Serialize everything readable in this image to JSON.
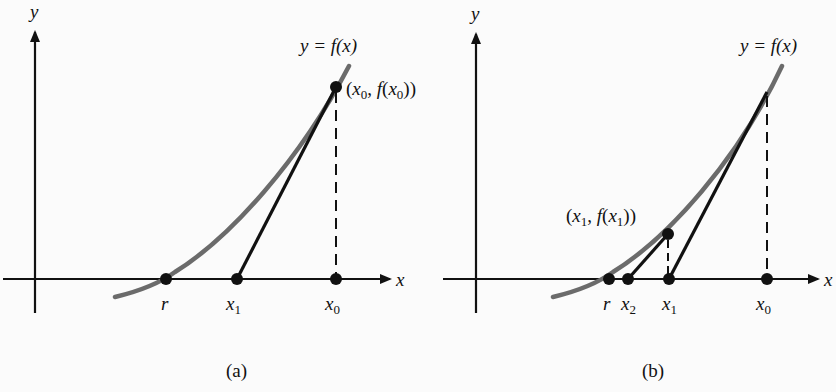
{
  "figure": {
    "colors": {
      "background": "#fbfbfb",
      "curve": "#6b6b6b",
      "axes": "#111111",
      "tangent": "#111111",
      "points": "#111111"
    },
    "panels": [
      {
        "id": "a",
        "caption": "(a)",
        "axis_labels": {
          "x": "x",
          "y": "y"
        },
        "curve_label": "y = f(x)",
        "point_label": {
          "open": "(",
          "var": "x",
          "sub": "0",
          "mid": ", ",
          "func": "f",
          "close": "))",
          "full": "(x0, f(x0))"
        },
        "axis_points": [
          {
            "name": "r",
            "label": "r"
          },
          {
            "name": "x1",
            "label": "x",
            "sub": "1"
          },
          {
            "name": "x0",
            "label": "x",
            "sub": "0"
          }
        ]
      },
      {
        "id": "b",
        "caption": "(b)",
        "axis_labels": {
          "x": "x",
          "y": "y"
        },
        "curve_label": "y = f(x)",
        "point_label": {
          "open": "(",
          "var": "x",
          "sub": "1",
          "mid": ", ",
          "func": "f",
          "close": "))",
          "full": "(x1, f(x1))"
        },
        "axis_points": [
          {
            "name": "r",
            "label": "r"
          },
          {
            "name": "x2",
            "label": "x",
            "sub": "2"
          },
          {
            "name": "x1",
            "label": "x",
            "sub": "1"
          },
          {
            "name": "x0",
            "label": "x",
            "sub": "0"
          }
        ]
      }
    ]
  }
}
